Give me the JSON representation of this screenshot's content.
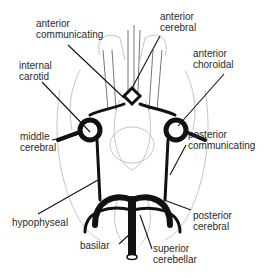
{
  "diagram": {
    "labels": {
      "anterior_communicating": "anterior\ncommunicating",
      "anterior_cerebral": "anterior\ncerebral",
      "internal_carotid": "internal\ncarotid",
      "anterior_choroidal": "anterior\nchoroidal",
      "middle_cerebral": "middle\ncerebral",
      "posterior_communicating": "posterior\ncommunicating",
      "hypophyseal": "hypophyseal",
      "posterior_cerebral": "posterior\ncerebral",
      "basilar": "basilar",
      "superior_cerebellar": "superior\ncerebellar"
    },
    "colors": {
      "ink": "#111111",
      "sketch": "#9a9a9a",
      "text": "#2a2a2a"
    }
  }
}
